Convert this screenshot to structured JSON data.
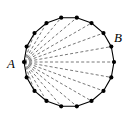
{
  "figure": {
    "kind": "geometry-diagram",
    "canvas": {
      "width": 136,
      "height": 126,
      "background": "#ffffff"
    },
    "polygon": {
      "name": "regular-polygon",
      "sides": 18,
      "center": {
        "x": 69,
        "y": 62
      },
      "radius": 45,
      "start_angle_deg": 180,
      "stroke_color": "#000000",
      "stroke_width": 1.1,
      "fill": "none"
    },
    "vertex_markers": {
      "name": "vertex-dot",
      "radius": 2.1,
      "color": "#000000"
    },
    "diagonals": {
      "name": "diagonals-from-A",
      "from_vertex_index": 0,
      "count": 15,
      "stroke_color": "#555555",
      "stroke_width": 0.8,
      "dash_pattern": "3,2.2"
    },
    "labels": [
      {
        "id": "A",
        "text": "A",
        "vertex_index": 0,
        "x": 7,
        "y": 57
      },
      {
        "id": "B",
        "text": "B",
        "vertex_index": 14,
        "x": 114,
        "y": 31
      }
    ]
  }
}
